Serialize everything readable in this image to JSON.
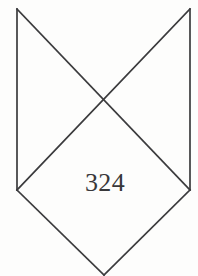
{
  "figure": {
    "background_color": "#fdfdfc",
    "line_color": "#3b3b3d",
    "line_width": 1.7,
    "label_color": "#38383a",
    "canvas": {
      "width": 198,
      "height": 276
    },
    "labels": {
      "area_value": "324"
    },
    "vertices": {
      "top_left": {
        "x": 17,
        "y": 9
      },
      "top_right": {
        "x": 190,
        "y": 9
      },
      "mid_left": {
        "x": 17,
        "y": 190
      },
      "mid_right": {
        "x": 190,
        "y": 190
      },
      "center": {
        "x": 104,
        "y": 100
      },
      "bottom": {
        "x": 104,
        "y": 275
      }
    },
    "segments": [
      {
        "name": "left-vertical-edge",
        "d": "M 17 9 L 17 190"
      },
      {
        "name": "right-vertical-edge",
        "d": "M 190 9 L 190 190"
      },
      {
        "name": "diagonal-top-left-to-mid-right",
        "d": "M 17 9 L 190 190"
      },
      {
        "name": "diagonal-top-right-to-mid-left",
        "d": "M 190 9 L 17 190"
      },
      {
        "name": "lower-left-edge",
        "d": "M 17 190 L 104 275"
      },
      {
        "name": "lower-right-edge",
        "d": "M 190 190 L 104 275"
      }
    ]
  }
}
